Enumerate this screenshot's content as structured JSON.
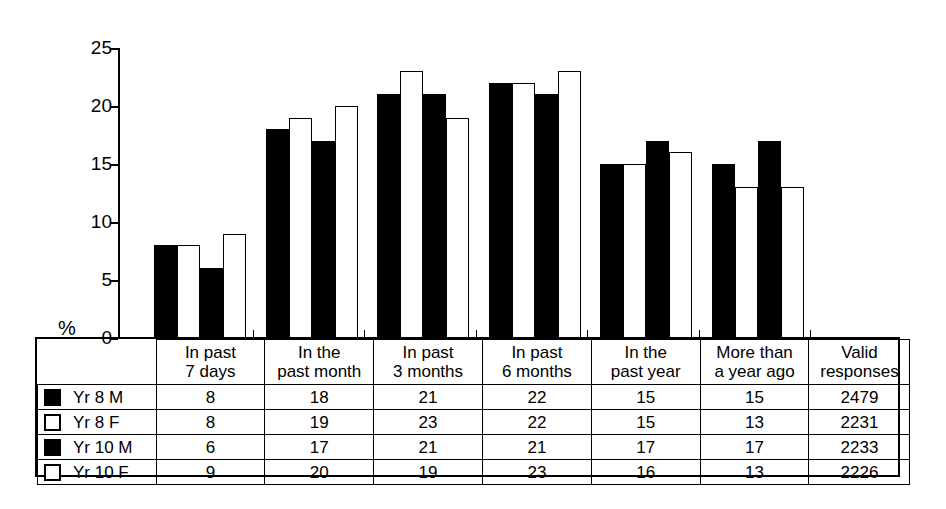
{
  "axis": {
    "unit_label": "%",
    "ticks": [
      0,
      5,
      10,
      15,
      20,
      25
    ]
  },
  "table": {
    "legend_header": "",
    "column_headers": [
      {
        "line1": "In past",
        "line2": "7 days"
      },
      {
        "line1": "In the",
        "line2": "past month"
      },
      {
        "line1": "In past",
        "line2": "3 months"
      },
      {
        "line1": "In past",
        "line2": "6 months"
      },
      {
        "line1": "In the",
        "line2": "past year"
      },
      {
        "line1": "More than",
        "line2": "a year ago"
      },
      {
        "line1": "Valid",
        "line2": "responses"
      }
    ],
    "rows": [
      {
        "label": "Yr 8 M",
        "swatch": "dark",
        "values": [
          "8",
          "18",
          "21",
          "22",
          "15",
          "15",
          "2479"
        ]
      },
      {
        "label": "Yr 8 F",
        "swatch": "light",
        "values": [
          "8",
          "19",
          "23",
          "22",
          "15",
          "13",
          "2231"
        ]
      },
      {
        "label": "Yr 10 M",
        "swatch": "dark",
        "values": [
          "6",
          "17",
          "21",
          "21",
          "17",
          "17",
          "2233"
        ]
      },
      {
        "label": "Yr 10 F",
        "swatch": "light",
        "values": [
          "9",
          "20",
          "19",
          "23",
          "16",
          "13",
          "2226"
        ]
      }
    ]
  },
  "chart_data": {
    "type": "bar",
    "title": "",
    "xlabel": "",
    "ylabel": "%",
    "ylim": [
      0,
      25
    ],
    "yticks": [
      0,
      5,
      10,
      15,
      20,
      25
    ],
    "grid": false,
    "legend_position": "table-below",
    "categories": [
      "In past 7 days",
      "In the past month",
      "In past 3 months",
      "In past 6 months",
      "In the past year",
      "More than a year ago"
    ],
    "series": [
      {
        "name": "Yr 8 M",
        "fill": "black",
        "values": [
          8,
          18,
          21,
          22,
          15,
          15
        ],
        "valid_responses": 2479
      },
      {
        "name": "Yr 8 F",
        "fill": "white",
        "values": [
          8,
          19,
          23,
          22,
          15,
          13
        ],
        "valid_responses": 2231
      },
      {
        "name": "Yr 10 M",
        "fill": "black",
        "values": [
          6,
          17,
          21,
          21,
          17,
          17
        ],
        "valid_responses": 2233
      },
      {
        "name": "Yr 10 F",
        "fill": "white",
        "values": [
          9,
          20,
          19,
          23,
          16,
          13
        ],
        "valid_responses": 2226
      }
    ]
  },
  "colors": {
    "dark_series": "#000000",
    "light_series": "#ffffff",
    "outline": "#000000",
    "background": "#ffffff"
  }
}
